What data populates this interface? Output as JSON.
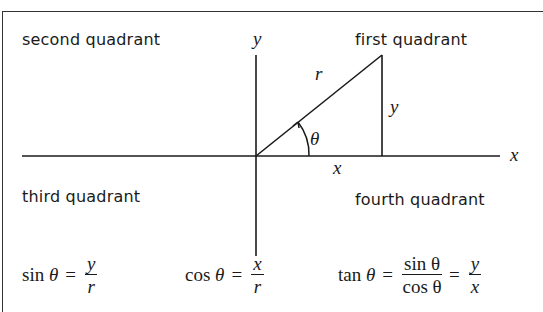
{
  "quadrants": {
    "first": "first quadrant",
    "second": "second quadrant",
    "third": "third quadrant",
    "fourth": "fourth quadrant"
  },
  "axes": {
    "x_label": "x",
    "y_label": "y"
  },
  "triangle": {
    "hypotenuse_label": "r",
    "opposite_label": "y",
    "adjacent_label": "x",
    "angle_label": "θ"
  },
  "formulas": {
    "sin": {
      "lhs_fn": "sin",
      "lhs_var": "θ",
      "eq": "=",
      "num": "y",
      "den": "r"
    },
    "cos": {
      "lhs_fn": "cos",
      "lhs_var": "θ",
      "eq": "=",
      "num": "x",
      "den": "r"
    },
    "tan": {
      "lhs_fn": "tan",
      "lhs_var": "θ",
      "eq": "=",
      "num1": "sin θ",
      "den1": "cos θ",
      "eq2": "=",
      "num2": "y",
      "den2": "x"
    }
  },
  "colors": {
    "ink": "#1a1a1a",
    "background": "#ffffff"
  }
}
